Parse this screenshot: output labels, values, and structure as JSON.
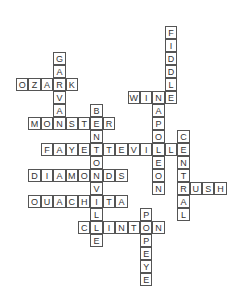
{
  "puzzle": {
    "cell_width": 12.4,
    "cell_height": 13,
    "origin_x": 16,
    "origin_y": 26,
    "words": [
      {
        "answer": "FIDDLE",
        "direction": "down",
        "col": 12,
        "row": 0
      },
      {
        "answer": "GARVAN",
        "direction": "down",
        "col": 3,
        "row": 2
      },
      {
        "answer": "OZARK",
        "direction": "across",
        "col": 0,
        "row": 4
      },
      {
        "answer": "WINE",
        "direction": "across",
        "col": 9,
        "row": 5
      },
      {
        "answer": "NAPOLEON",
        "direction": "down",
        "col": 11,
        "row": 5
      },
      {
        "answer": "BENTONVILLE",
        "direction": "down",
        "col": 6,
        "row": 6
      },
      {
        "answer": "MONSTER",
        "direction": "across",
        "col": 1,
        "row": 7
      },
      {
        "answer": "CENTRAL",
        "direction": "down",
        "col": 13,
        "row": 8
      },
      {
        "answer": "FAYETTEVILLE",
        "direction": "across",
        "col": 2,
        "row": 9
      },
      {
        "answer": "DIAMONDS",
        "direction": "across",
        "col": 1,
        "row": 11
      },
      {
        "answer": "RUSH",
        "direction": "across",
        "col": 13,
        "row": 12
      },
      {
        "answer": "OUACHITA",
        "direction": "across",
        "col": 1,
        "row": 13
      },
      {
        "answer": "POPEYE",
        "direction": "down",
        "col": 10,
        "row": 14
      },
      {
        "answer": "CLINTON",
        "direction": "across",
        "col": 5,
        "row": 15
      }
    ]
  }
}
